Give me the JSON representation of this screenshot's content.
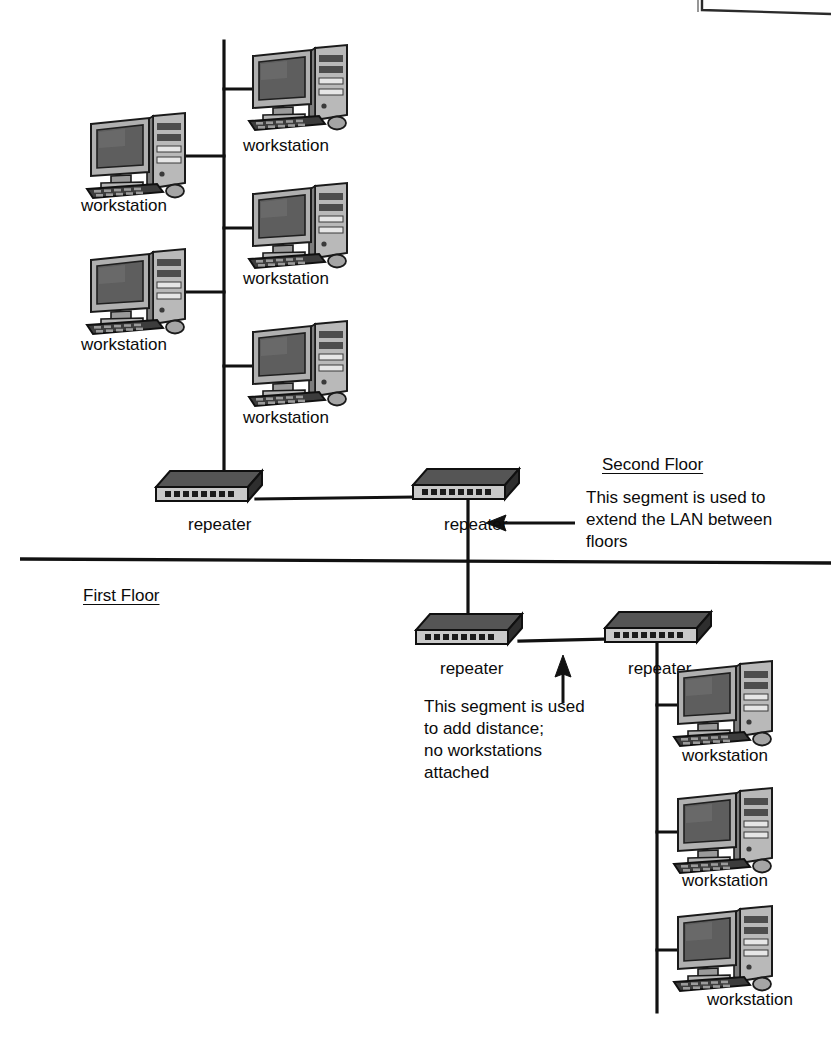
{
  "diagram": {
    "type": "network-topology"
  },
  "floors": [
    {
      "id": "second",
      "label": "Second Floor",
      "x": 602,
      "y": 458
    },
    {
      "id": "first",
      "label": "First Floor",
      "x": 83,
      "y": 589
    }
  ],
  "device_labels": {
    "workstation": "workstation",
    "repeater": "repeater"
  },
  "workstations": [
    {
      "id": "ws-top-right",
      "label": "workstation",
      "x": 247,
      "y": 42,
      "label_x": 243,
      "label_y": 139
    },
    {
      "id": "ws-upper-left",
      "label": "workstation",
      "x": 85,
      "y": 110,
      "label_x": 81,
      "label_y": 199
    },
    {
      "id": "ws-mid-right",
      "label": "workstation",
      "x": 247,
      "y": 180,
      "label_x": 243,
      "label_y": 272
    },
    {
      "id": "ws-lower-left",
      "label": "workstation",
      "x": 85,
      "y": 246,
      "label_x": 81,
      "label_y": 338
    },
    {
      "id": "ws-bottom-right",
      "label": "workstation",
      "x": 247,
      "y": 318,
      "label_x": 243,
      "label_y": 411
    },
    {
      "id": "ws-fl-1",
      "label": "workstation",
      "x": 672,
      "y": 658,
      "label_x": 682,
      "label_y": 749
    },
    {
      "id": "ws-fl-2",
      "label": "workstation",
      "x": 672,
      "y": 785,
      "label_x": 682,
      "label_y": 874
    },
    {
      "id": "ws-fl-3",
      "label": "workstation",
      "x": 672,
      "y": 903,
      "label_x": 707,
      "label_y": 996
    }
  ],
  "repeaters": [
    {
      "id": "rep-second-left",
      "label": "repeater",
      "x": 152,
      "y": 468,
      "label_x": 188,
      "label_y": 525
    },
    {
      "id": "rep-second-right",
      "label": "repeater",
      "x": 409,
      "y": 468,
      "label_x": 444,
      "label_y": 525
    },
    {
      "id": "rep-first-left",
      "label": "repeater",
      "x": 412,
      "y": 611,
      "label_x": 440,
      "label_y": 669
    },
    {
      "id": "rep-first-right",
      "label": "repeater",
      "x": 601,
      "y": 611,
      "label_x": 628,
      "label_y": 669
    }
  ],
  "annotations": [
    {
      "id": "note-extend-lan",
      "lines": [
        "This segment is used to",
        "extend the LAN between",
        "floors"
      ],
      "x": 586,
      "y": 489
    },
    {
      "id": "note-add-distance",
      "lines": [
        "This segment is used",
        "to add distance;",
        "no workstations",
        "attached"
      ],
      "x": 424,
      "y": 698
    }
  ],
  "colors": {
    "line": "#111111",
    "text": "#0b0b0b",
    "background": "#ffffff",
    "device_dark": "#3a3a3a",
    "device_mid": "#6e6e6e",
    "device_light": "#c9c9c9",
    "screen": "#565656"
  },
  "arrows": [
    {
      "id": "arrow-to-vertical-segment",
      "direction": "left",
      "x1": 575,
      "y1": 523,
      "x2": 486,
      "y2": 523
    },
    {
      "id": "arrow-to-horizontal-segment",
      "direction": "up",
      "x1": 563,
      "y1": 703,
      "x2": 563,
      "y2": 657
    }
  ]
}
